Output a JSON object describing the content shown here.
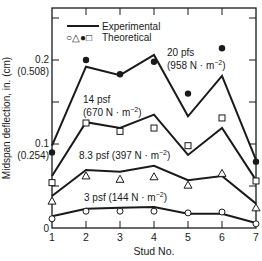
{
  "chart_data": {
    "type": "line",
    "title": "",
    "xlabel": "Stud No.",
    "ylabel": "Midspan deflection, in. (cm)",
    "x": [
      1,
      2,
      3,
      4,
      5,
      6,
      7
    ],
    "xlim": [
      1,
      7
    ],
    "ylim": [
      0,
      0.26
    ],
    "x_ticks": [
      "1",
      "2",
      "3",
      "4",
      "5",
      "6",
      "7"
    ],
    "y_ticks": [
      {
        "value": 0,
        "label": "0",
        "label2": ""
      },
      {
        "value": 0.1,
        "label": "0.1",
        "label2": "(0.254)"
      },
      {
        "value": 0.2,
        "label": "0.2",
        "label2": "(0.508)"
      }
    ],
    "grid": false,
    "legend": {
      "position": "upper-left",
      "entries": [
        {
          "symbol": "line",
          "label": "Experimental"
        },
        {
          "symbol": "○△●□",
          "label": "Theoretical"
        }
      ]
    },
    "series": [
      {
        "name": "20 pfs (958 N · m⁻²)",
        "label_line1": "20 pfs",
        "label_line2": "(958 N · m",
        "label_sup": "−2",
        "marker": "filled-circle",
        "experimental": [
          0.098,
          0.192,
          0.182,
          0.206,
          0.133,
          0.181,
          0.081
        ],
        "theoretical": [
          0.09,
          0.2,
          0.183,
          0.198,
          0.16,
          0.214,
          0.079
        ]
      },
      {
        "name": "14 psf (670 N · m⁻²)",
        "label_line1": "14 psf",
        "label_line2": "(670 N · m",
        "label_sup": "−2",
        "marker": "open-square",
        "experimental": [
          0.062,
          0.126,
          0.119,
          0.135,
          0.087,
          0.119,
          0.057
        ],
        "theoretical": [
          0.054,
          0.125,
          0.115,
          0.119,
          0.098,
          0.131,
          0.056
        ]
      },
      {
        "name": "8.3 psf (397 N · m⁻²)",
        "label_line1": "8.3 psf (397 N · m",
        "label_line2": "",
        "label_sup": "−2",
        "marker": "open-triangle",
        "experimental": [
          0.038,
          0.069,
          0.067,
          0.074,
          0.057,
          0.062,
          0.029
        ],
        "theoretical": [
          0.032,
          0.062,
          0.058,
          0.061,
          0.051,
          0.065,
          0.024
        ]
      },
      {
        "name": "3 psf (144 N · m⁻²)",
        "label_line1": "3 psf (144 N · m",
        "label_line2": "",
        "label_sup": "−2",
        "marker": "open-circle",
        "experimental": [
          0.014,
          0.023,
          0.024,
          0.025,
          0.017,
          0.017,
          0.006
        ],
        "theoretical": [
          0.011,
          0.02,
          0.02,
          0.02,
          0.018,
          0.019,
          0.005
        ]
      }
    ]
  }
}
